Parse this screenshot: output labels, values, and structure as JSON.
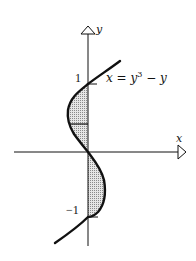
{
  "figure": {
    "type": "diagram",
    "axes": {
      "x_label": "x",
      "y_label": "y"
    },
    "tick_labels": {
      "y_pos": "1",
      "y_neg": "−1"
    },
    "curve_label": {
      "lhs": "x = y",
      "exponent": "3",
      "rhs": " − y"
    },
    "colors": {
      "stroke": "#111111",
      "shade": "#b8b8b8",
      "background": "#ffffff"
    }
  }
}
